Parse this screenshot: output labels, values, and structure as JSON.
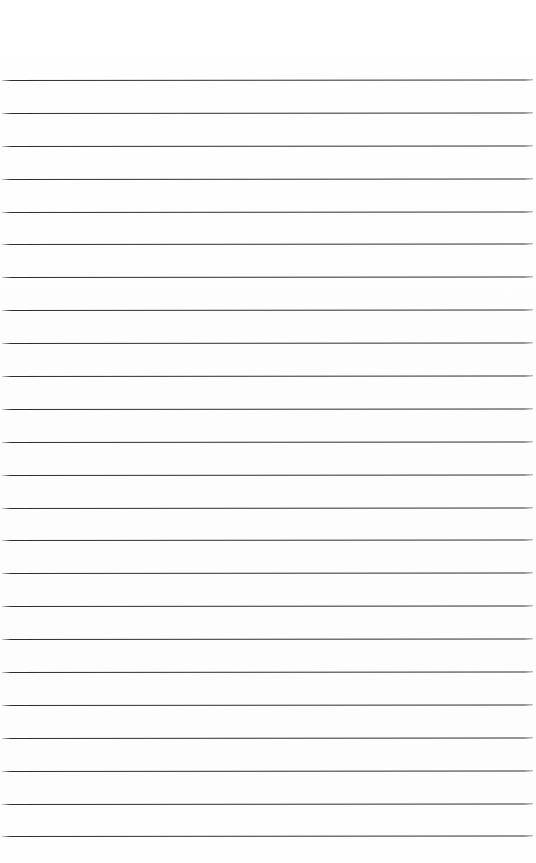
{
  "document": {
    "kind": "lined-paper",
    "title": "Lined Paper Sheet",
    "description": "Blank ruled notebook page with horizontal writing lines and no written content.",
    "width_px": 536,
    "height_px": 863,
    "background_color": "#fefefe",
    "page_color": "#ffffff",
    "has_text_content": false,
    "has_vertical_margin_rule": false,
    "written_text": ""
  },
  "ruling": {
    "line_count": 24,
    "line_color": "#2e2e2e",
    "line_thickness_px": 1,
    "line_spacing_px": 32.9,
    "first_line_y_px": 80,
    "last_line_y_px": 836,
    "line_start_x_px": 2,
    "line_end_x_px": 533,
    "line_length_px": 531,
    "style": "solid",
    "orientation": "horizontal"
  },
  "margins": {
    "top_px": 80,
    "bottom_px": 27,
    "left_px": 2,
    "right_px": 3
  },
  "lines": [
    {
      "index": 1,
      "y": 80,
      "content": ""
    },
    {
      "index": 2,
      "y": 112.9,
      "content": ""
    },
    {
      "index": 3,
      "y": 145.8,
      "content": ""
    },
    {
      "index": 4,
      "y": 178.7,
      "content": ""
    },
    {
      "index": 5,
      "y": 211.6,
      "content": ""
    },
    {
      "index": 6,
      "y": 244.4,
      "content": ""
    },
    {
      "index": 7,
      "y": 277.3,
      "content": ""
    },
    {
      "index": 8,
      "y": 310.2,
      "content": ""
    },
    {
      "index": 9,
      "y": 343.1,
      "content": ""
    },
    {
      "index": 10,
      "y": 376.0,
      "content": ""
    },
    {
      "index": 11,
      "y": 408.9,
      "content": ""
    },
    {
      "index": 12,
      "y": 441.7,
      "content": ""
    },
    {
      "index": 13,
      "y": 474.6,
      "content": ""
    },
    {
      "index": 14,
      "y": 507.5,
      "content": ""
    },
    {
      "index": 15,
      "y": 540.4,
      "content": ""
    },
    {
      "index": 16,
      "y": 573.3,
      "content": ""
    },
    {
      "index": 17,
      "y": 606.2,
      "content": ""
    },
    {
      "index": 18,
      "y": 639.0,
      "content": ""
    },
    {
      "index": 19,
      "y": 671.9,
      "content": ""
    },
    {
      "index": 20,
      "y": 704.8,
      "content": ""
    },
    {
      "index": 21,
      "y": 737.7,
      "content": ""
    },
    {
      "index": 22,
      "y": 770.6,
      "content": ""
    },
    {
      "index": 23,
      "y": 803.5,
      "content": ""
    },
    {
      "index": 24,
      "y": 836.3,
      "content": ""
    }
  ]
}
